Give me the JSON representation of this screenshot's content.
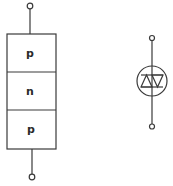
{
  "diagram": {
    "structure": {
      "layers": [
        {
          "label": "p"
        },
        {
          "label": "n"
        },
        {
          "label": "p"
        }
      ]
    },
    "symbol": {
      "name": "diac-symbol"
    },
    "colors": {
      "line": "#3a3a3a",
      "background": "#ffffff"
    }
  }
}
